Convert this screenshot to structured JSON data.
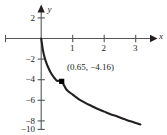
{
  "chart_data": {
    "type": "line",
    "title": "",
    "xlabel": "x",
    "ylabel": "y",
    "xlim": [
      -0.45,
      3.45
    ],
    "ylim": [
      -10.3,
      2.6
    ],
    "grid": false,
    "legend": null,
    "x_ticks": [
      1,
      2,
      3
    ],
    "x_tick_labels": [
      "1",
      "2",
      "3"
    ],
    "y_ticks": [
      2,
      -2,
      -4,
      -6,
      -8,
      -10
    ],
    "y_tick_labels": [
      "2",
      "−2",
      "−4",
      "−6",
      "−8",
      "−10"
    ],
    "series": [
      {
        "name": "curve",
        "color": "#231f20",
        "x": [
          0.0,
          0.05,
          0.1,
          0.15,
          0.2,
          0.3,
          0.4,
          0.5,
          0.65,
          0.8,
          1.0,
          1.2,
          1.4,
          1.6,
          1.8,
          2.0,
          2.2,
          2.4,
          2.6,
          2.8,
          3.0,
          3.15
        ],
        "y": [
          0.0,
          -1.05,
          -1.75,
          -2.25,
          -2.65,
          -3.3,
          -3.75,
          -4.1,
          -4.16,
          -4.95,
          -5.45,
          -5.9,
          -6.25,
          -6.55,
          -6.85,
          -7.1,
          -7.35,
          -7.55,
          -7.8,
          -8.0,
          -8.2,
          -8.35
        ]
      }
    ],
    "markers": [
      {
        "name": "highlighted-point",
        "x": 0.65,
        "y": -4.16,
        "label": "(0.65,  −4.16)",
        "shape": "square",
        "color": "#000000"
      }
    ],
    "axis_arrows": {
      "x": "right",
      "y": "up"
    },
    "axis_color": "#231f20"
  },
  "labels": {
    "x_axis_name": "x",
    "y_axis_name": "y",
    "y_2": "2",
    "y_m2": "−2",
    "y_m4": "−4",
    "y_m6": "−6",
    "y_m8": "−8",
    "y_m10": "−10",
    "x_1": "1",
    "x_2": "2",
    "x_3": "3",
    "point_annotation": "(0.65,  −4.16)"
  }
}
